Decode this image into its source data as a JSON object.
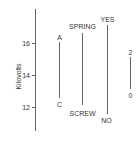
{
  "diagram": {
    "y_axis": {
      "label": "Kilovolts",
      "ticks": [
        {
          "value": 16,
          "label": "16"
        },
        {
          "value": 14,
          "label": "14"
        },
        {
          "value": 12,
          "label": "12"
        }
      ],
      "range": [
        10.5,
        18.1
      ]
    },
    "bars": [
      {
        "id": "a-c",
        "top_label": "A",
        "bottom_label": "C",
        "top_value": 16.0,
        "bottom_value": 12.6
      },
      {
        "id": "spring-screw",
        "top_label": "SPRING",
        "bottom_label": "SCREW",
        "top_value": 16.6,
        "bottom_value": 12.1
      },
      {
        "id": "yes-no",
        "top_label": "YES",
        "bottom_label": "NO",
        "top_value": 17.1,
        "bottom_value": 11.6
      }
    ],
    "scale_bar": {
      "top_label": "2",
      "bottom_label": "0",
      "span_units": 2
    },
    "colors": {
      "line": "#666666",
      "text": "#333333",
      "background": "#ffffff"
    }
  }
}
